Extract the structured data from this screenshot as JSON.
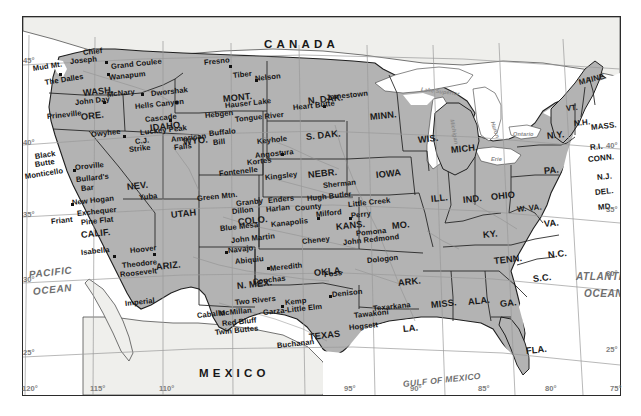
{
  "map": {
    "title": "Map of the contiguous United States showing major dams and reservoirs",
    "projection_note": "lambert-conformal-conic",
    "colors": {
      "land_us": "#b3b3b3",
      "land_foreign": "#efefec",
      "water": "#ffffff",
      "border": "#2b2b2b",
      "graticule": "#9a9a9a",
      "text": "#1b1b1b",
      "ocean_text": "#6f6f6f"
    },
    "countries": [
      {
        "name": "CANADA",
        "x": 241,
        "y": 22
      },
      {
        "name": "MEXICO",
        "x": 176,
        "y": 351
      }
    ],
    "oceans": [
      {
        "name": "PACIFIC",
        "x": 6,
        "y": 253
      },
      {
        "name": "OCEAN",
        "x": 10,
        "y": 270
      },
      {
        "name": "ATLANTIC",
        "x": 553,
        "y": 255
      },
      {
        "name": "OCEAN",
        "x": 561,
        "y": 272
      },
      {
        "name": "GULF OF MEXICO",
        "x": 380,
        "y": 363
      }
    ],
    "lakes": [
      {
        "name": "Lake Superior",
        "x": 398,
        "y": 70
      },
      {
        "name": "Huron",
        "x": 463,
        "y": 110
      },
      {
        "name": "Michigan",
        "x": 428,
        "y": 117
      },
      {
        "name": "Erie",
        "x": 470,
        "y": 141
      },
      {
        "name": "Ontario",
        "x": 489,
        "y": 118
      }
    ],
    "states": [
      {
        "name": "WASH.",
        "x": 60,
        "y": 72
      },
      {
        "name": "ORE.",
        "x": 58,
        "y": 96
      },
      {
        "name": "IDAHO",
        "x": 127,
        "y": 107
      },
      {
        "name": "MONT.",
        "x": 200,
        "y": 78
      },
      {
        "name": "WYO.",
        "x": 160,
        "y": 121
      },
      {
        "name": "NEV.",
        "x": 104,
        "y": 166
      },
      {
        "name": "UTAH",
        "x": 148,
        "y": 194
      },
      {
        "name": "CALIF.",
        "x": 58,
        "y": 214
      },
      {
        "name": "ARIZ.",
        "x": 133,
        "y": 246
      },
      {
        "name": "COLO.",
        "x": 215,
        "y": 201
      },
      {
        "name": "N. MEX.",
        "x": 214,
        "y": 265
      },
      {
        "name": "N. DAK.",
        "x": 285,
        "y": 80
      },
      {
        "name": "S. DAK.",
        "x": 283,
        "y": 116
      },
      {
        "name": "NEBR.",
        "x": 285,
        "y": 154
      },
      {
        "name": "KANS.",
        "x": 313,
        "y": 206
      },
      {
        "name": "OKLA.",
        "x": 291,
        "y": 252
      },
      {
        "name": "TEXAS",
        "x": 286,
        "y": 316
      },
      {
        "name": "MINN.",
        "x": 347,
        "y": 96
      },
      {
        "name": "IOWA",
        "x": 353,
        "y": 154
      },
      {
        "name": "MO.",
        "x": 369,
        "y": 205
      },
      {
        "name": "ARK.",
        "x": 375,
        "y": 262
      },
      {
        "name": "LA.",
        "x": 380,
        "y": 308
      },
      {
        "name": "WIS.",
        "x": 395,
        "y": 119
      },
      {
        "name": "ILL.",
        "x": 408,
        "y": 178
      },
      {
        "name": "IND.",
        "x": 440,
        "y": 179
      },
      {
        "name": "MICH.",
        "x": 444,
        "y": 129
      },
      {
        "name": "OHIO",
        "x": 468,
        "y": 176
      },
      {
        "name": "KY.",
        "x": 460,
        "y": 214
      },
      {
        "name": "TENN.",
        "x": 471,
        "y": 240
      },
      {
        "name": "MISS.",
        "x": 408,
        "y": 284
      },
      {
        "name": "ALA.",
        "x": 445,
        "y": 281
      },
      {
        "name": "GA.",
        "x": 477,
        "y": 283
      },
      {
        "name": "FLA.",
        "x": 503,
        "y": 330
      },
      {
        "name": "S.C.",
        "x": 510,
        "y": 258
      },
      {
        "name": "N.C.",
        "x": 525,
        "y": 234
      },
      {
        "name": "VA.",
        "x": 521,
        "y": 203
      },
      {
        "name": "W. VA.",
        "x": 494,
        "y": 189
      },
      {
        "name": "PA.",
        "x": 521,
        "y": 150
      },
      {
        "name": "N.Y.",
        "x": 524,
        "y": 115
      },
      {
        "name": "MD.",
        "x": 575,
        "y": 187
      },
      {
        "name": "DEL.",
        "x": 572,
        "y": 172
      },
      {
        "name": "N.J.",
        "x": 574,
        "y": 157
      },
      {
        "name": "CONN.",
        "x": 572,
        "y": 139
      },
      {
        "name": "R.I.",
        "x": 571,
        "y": 127
      },
      {
        "name": "MASS.",
        "x": 592,
        "y": 107
      },
      {
        "name": "N.H.",
        "x": 569,
        "y": 103
      },
      {
        "name": "VT.",
        "x": 562,
        "y": 88
      },
      {
        "name": "MAINE",
        "x": 590,
        "y": 65
      }
    ],
    "dams": [
      {
        "name": "Mud Mt.",
        "x": 16,
        "y": 53,
        "rot": "rot-l"
      },
      {
        "name": "Chief",
        "x": 62,
        "y": 38
      },
      {
        "name": "Joseph",
        "x": 56,
        "y": 46
      },
      {
        "name": "Grand Coulee",
        "x": 94,
        "y": 52
      },
      {
        "name": "Wanapum",
        "x": 89,
        "y": 63
      },
      {
        "name": "The Dalles",
        "x": 27,
        "y": 70,
        "rot": "rot-l"
      },
      {
        "name": "McNary",
        "x": 91,
        "y": 80
      },
      {
        "name": "John Day",
        "x": 56,
        "y": 88
      },
      {
        "name": "Dworshak",
        "x": 133,
        "y": 79
      },
      {
        "name": "Hells Canyon",
        "x": 119,
        "y": 92
      },
      {
        "name": "Prineville",
        "x": 30,
        "y": 100
      },
      {
        "name": "Cascade",
        "x": 128,
        "y": 104
      },
      {
        "name": "Owyhee",
        "x": 74,
        "y": 118
      },
      {
        "name": "Luckey Peak",
        "x": 123,
        "y": 115
      },
      {
        "name": "C.J.",
        "x": 115,
        "y": 124
      },
      {
        "name": "Strike",
        "x": 110,
        "y": 132
      },
      {
        "name": "American",
        "x": 152,
        "y": 122
      },
      {
        "name": "Falls",
        "x": 153,
        "y": 130
      },
      {
        "name": "Fresno",
        "x": 185,
        "y": 47
      },
      {
        "name": "Tiber",
        "x": 212,
        "y": 59
      },
      {
        "name": "Nelson",
        "x": 234,
        "y": 62
      },
      {
        "name": "Hauser Lake",
        "x": 206,
        "y": 89
      },
      {
        "name": "Hebgen",
        "x": 186,
        "y": 99
      },
      {
        "name": "Tongue River",
        "x": 218,
        "y": 103
      },
      {
        "name": "Buffalo",
        "x": 189,
        "y": 117
      },
      {
        "name": "Bill",
        "x": 193,
        "y": 126
      },
      {
        "name": "Keyhole",
        "x": 238,
        "y": 125
      },
      {
        "name": "Heart Butte",
        "x": 276,
        "y": 91
      },
      {
        "name": "Jamestown",
        "x": 309,
        "y": 81
      },
      {
        "name": "Angostura",
        "x": 236,
        "y": 139
      },
      {
        "name": "Black",
        "x": 14,
        "y": 140
      },
      {
        "name": "Butte",
        "x": 15,
        "y": 148
      },
      {
        "name": "Monticello",
        "x": 6,
        "y": 160
      },
      {
        "name": "Oroville",
        "x": 56,
        "y": 150
      },
      {
        "name": "Bullard's",
        "x": 57,
        "y": 163
      },
      {
        "name": "Bar",
        "x": 61,
        "y": 171
      },
      {
        "name": "New Hogan",
        "x": 53,
        "y": 185
      },
      {
        "name": "Exchequer",
        "x": 58,
        "y": 196
      },
      {
        "name": "Friant",
        "x": 32,
        "y": 204
      },
      {
        "name": "Pine Flat",
        "x": 62,
        "y": 205
      },
      {
        "name": "Isabella",
        "x": 62,
        "y": 235
      },
      {
        "name": "Yuba",
        "x": 120,
        "y": 180
      },
      {
        "name": "Green Mtn.",
        "x": 180,
        "y": 181
      },
      {
        "name": "Fontenelle",
        "x": 203,
        "y": 156
      },
      {
        "name": "Kortes",
        "x": 226,
        "y": 146
      },
      {
        "name": "Kingsley",
        "x": 248,
        "y": 160
      },
      {
        "name": "Granby",
        "x": 217,
        "y": 186
      },
      {
        "name": "Dillon",
        "x": 213,
        "y": 194
      },
      {
        "name": "Enders",
        "x": 249,
        "y": 184
      },
      {
        "name": "Harlan",
        "x": 247,
        "y": 193
      },
      {
        "name": "County",
        "x": 276,
        "y": 191
      },
      {
        "name": "Hugh Butler",
        "x": 288,
        "y": 182
      },
      {
        "name": "Sherman",
        "x": 304,
        "y": 169
      },
      {
        "name": "Little Creek",
        "x": 330,
        "y": 188
      },
      {
        "name": "Milford",
        "x": 298,
        "y": 198
      },
      {
        "name": "Perry",
        "x": 331,
        "y": 199
      },
      {
        "name": "Blue Mesa",
        "x": 201,
        "y": 211
      },
      {
        "name": "Kanapolis",
        "x": 253,
        "y": 207
      },
      {
        "name": "John Martin",
        "x": 212,
        "y": 223
      },
      {
        "name": "Cheney",
        "x": 283,
        "y": 224
      },
      {
        "name": "Pomona",
        "x": 337,
        "y": 217
      },
      {
        "name": "John Redmond",
        "x": 326,
        "y": 225
      },
      {
        "name": "Hoover",
        "x": 111,
        "y": 233
      },
      {
        "name": "Theodore",
        "x": 103,
        "y": 248
      },
      {
        "name": "Roosevelt",
        "x": 101,
        "y": 257
      },
      {
        "name": "Imperial",
        "x": 106,
        "y": 286
      },
      {
        "name": "Navajo",
        "x": 209,
        "y": 233
      },
      {
        "name": "Abiquiu",
        "x": 216,
        "y": 244
      },
      {
        "name": "Meredith",
        "x": 251,
        "y": 251
      },
      {
        "name": "Conchas",
        "x": 234,
        "y": 264
      },
      {
        "name": "Foss",
        "x": 304,
        "y": 257
      },
      {
        "name": "Dologon",
        "x": 348,
        "y": 243
      },
      {
        "name": "Two Rivers",
        "x": 216,
        "y": 285
      },
      {
        "name": "Kemp",
        "x": 266,
        "y": 285
      },
      {
        "name": "Denison",
        "x": 313,
        "y": 277
      },
      {
        "name": "Garza-Little Elm",
        "x": 248,
        "y": 295
      },
      {
        "name": "McMillan",
        "x": 200,
        "y": 296
      },
      {
        "name": "Texarkana",
        "x": 355,
        "y": 291
      },
      {
        "name": "Tawakoni",
        "x": 335,
        "y": 298
      },
      {
        "name": "Red Bluff",
        "x": 203,
        "y": 306
      },
      {
        "name": "Twin Buttes",
        "x": 196,
        "y": 315
      },
      {
        "name": "Hogsett",
        "x": 330,
        "y": 310
      },
      {
        "name": "Caballo",
        "x": 178,
        "y": 298
      },
      {
        "name": "Buchanan",
        "x": 258,
        "y": 328
      }
    ],
    "graticule": {
      "latitudes": [
        {
          "label": "45",
          "x": 1,
          "y": 56
        },
        {
          "label": "40",
          "x": 1,
          "y": 138
        },
        {
          "label": "35",
          "x": 1,
          "y": 210
        },
        {
          "label": "30",
          "x": 1,
          "y": 275
        },
        {
          "label": "25",
          "x": 1,
          "y": 348
        },
        {
          "label": "40",
          "x": 625,
          "y": 141
        },
        {
          "label": "35",
          "x": 625,
          "y": 205
        },
        {
          "label": "30",
          "x": 625,
          "y": 269
        },
        {
          "label": "25",
          "x": 625,
          "y": 345
        }
      ],
      "longitudes": [
        {
          "label": "120",
          "x": 22,
          "y": 396
        },
        {
          "label": "115",
          "x": 90,
          "y": 396
        },
        {
          "label": "110",
          "x": 159,
          "y": 396
        },
        {
          "label": "95",
          "x": 344,
          "y": 396
        },
        {
          "label": "90",
          "x": 410,
          "y": 396
        },
        {
          "label": "85",
          "x": 478,
          "y": 396
        },
        {
          "label": "80",
          "x": 545,
          "y": 396
        },
        {
          "label": "75",
          "x": 610,
          "y": 396
        }
      ]
    }
  }
}
